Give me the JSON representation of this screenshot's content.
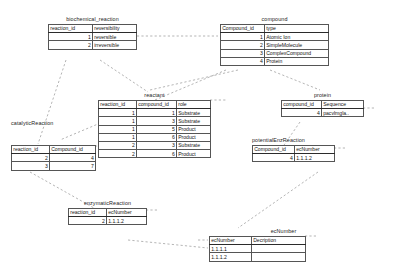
{
  "diagram": {
    "title_visible": false,
    "background": "#ffffff",
    "line_color": "#9a9a9a",
    "border_color": "#2b2b2b"
  },
  "entities": {
    "biochemical_reaction": {
      "name": "biochemical_reaction",
      "columns": [
        "reaction_id",
        "reversibility"
      ],
      "rows": [
        {
          "reaction_id": "1",
          "reversibility": "reversible"
        },
        {
          "reaction_id": "2",
          "reversibility": "irreversible"
        }
      ]
    },
    "compound": {
      "name": "compound",
      "columns": [
        "Compound_id",
        "type"
      ],
      "rows": [
        {
          "Compound_id": "1",
          "type": "Atomic Ion"
        },
        {
          "Compound_id": "2",
          "type": "SimpleMolecule"
        },
        {
          "Compound_id": "3",
          "type": "ComplexCompound"
        },
        {
          "Compound_id": "4",
          "type": "Protein"
        }
      ]
    },
    "reactant": {
      "name": "reactant",
      "columns": [
        "reaction_id",
        "compound_id",
        "role"
      ],
      "rows": [
        {
          "reaction_id": "1",
          "compound_id": "1",
          "role": "Substrate"
        },
        {
          "reaction_id": "1",
          "compound_id": "3",
          "role": "Substrate"
        },
        {
          "reaction_id": "1",
          "compound_id": "5",
          "role": "Product"
        },
        {
          "reaction_id": "1",
          "compound_id": "6",
          "role": "Product"
        },
        {
          "reaction_id": "2",
          "compound_id": "3",
          "role": "Substrate"
        },
        {
          "reaction_id": "2",
          "compound_id": "6",
          "role": "Product"
        }
      ]
    },
    "protein": {
      "name": "protein",
      "columns": [
        "compound_id",
        "Sequence"
      ],
      "rows": [
        {
          "compound_id": "4",
          "Sequence": "pacvlmgla.."
        }
      ]
    },
    "catalyticReaction": {
      "name": "catalyticReaction",
      "columns": [
        "reaction_id",
        "Compound_id"
      ],
      "rows": [
        {
          "reaction_id": "2",
          "Compound_id": "4"
        },
        {
          "reaction_id": "3",
          "Compound_id": "7"
        }
      ]
    },
    "potentialEnzReaction": {
      "name": "potentialEnzReaction",
      "columns": [
        "Compound_id",
        "ecNumber"
      ],
      "rows": [
        {
          "Compound_id": "4",
          "ecNumber": "1.1.1.2"
        }
      ]
    },
    "enzymaticReaction": {
      "name": "enzymaticReaction",
      "columns": [
        "reaction_id",
        "ecNumber"
      ],
      "rows": [
        {
          "reaction_id": "2",
          "ecNumber": "1.1.1.2"
        }
      ]
    },
    "ecNumber": {
      "name": "ecNumber",
      "columns": [
        "ecNumber",
        "Decription"
      ],
      "rows": [
        {
          "ecNumber": "1.1.1.1",
          "Decription": ""
        },
        {
          "ecNumber": "1.1.1.2",
          "Decription": ""
        }
      ]
    }
  }
}
